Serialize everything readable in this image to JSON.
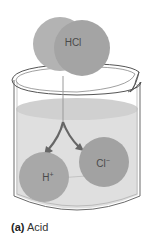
{
  "figure": {
    "molecule": {
      "label": "HCl",
      "color": "#a9a9a9"
    },
    "ions": [
      {
        "label": "H",
        "charge": "+",
        "color": "#a8a8a8"
      },
      {
        "label": "Cl",
        "charge": "−",
        "color": "#a8a8a8"
      }
    ],
    "beaker": {
      "glass_stroke": "#5a5a5a",
      "liquid_color": "#d6d6d6"
    },
    "arrow_color": "#666666",
    "caption": {
      "tag": "(a)",
      "text": "Acid"
    }
  }
}
